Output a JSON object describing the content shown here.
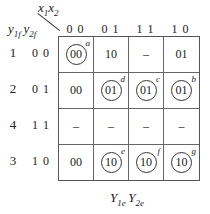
{
  "header": {
    "x_var1": "x",
    "x_sub1": "1",
    "x_var2": "x",
    "x_sub2": "2",
    "y_var1": "y",
    "y_sub1": "1f",
    "y_var2": "y",
    "y_sub2": "2f"
  },
  "columns": [
    "0 0",
    "0 1",
    "1 1",
    "1 0"
  ],
  "rows": [
    {
      "state": "1",
      "code": "0 0",
      "cells": [
        {
          "value": "00",
          "circled": true,
          "tag": "a"
        },
        {
          "value": "10",
          "circled": false,
          "tag": ""
        },
        {
          "value": "–",
          "circled": false,
          "tag": ""
        },
        {
          "value": "01",
          "circled": false,
          "tag": ""
        }
      ]
    },
    {
      "state": "2",
      "code": "0 1",
      "cells": [
        {
          "value": "00",
          "circled": false,
          "tag": ""
        },
        {
          "value": "01",
          "circled": true,
          "tag": "d"
        },
        {
          "value": "01",
          "circled": true,
          "tag": "c"
        },
        {
          "value": "01",
          "circled": true,
          "tag": "b"
        }
      ]
    },
    {
      "state": "4",
      "code": "1 1",
      "cells": [
        {
          "value": "–",
          "circled": false,
          "tag": ""
        },
        {
          "value": "–",
          "circled": false,
          "tag": ""
        },
        {
          "value": "–",
          "circled": false,
          "tag": ""
        },
        {
          "value": "–",
          "circled": false,
          "tag": ""
        }
      ]
    },
    {
      "state": "3",
      "code": "1 0",
      "cells": [
        {
          "value": "00",
          "circled": false,
          "tag": ""
        },
        {
          "value": "10",
          "circled": true,
          "tag": "e"
        },
        {
          "value": "10",
          "circled": true,
          "tag": "f"
        },
        {
          "value": "10",
          "circled": true,
          "tag": "g"
        }
      ]
    }
  ],
  "footer": {
    "v1": "Y",
    "s1": "1e",
    "v2": "Y",
    "s2": "2e"
  }
}
